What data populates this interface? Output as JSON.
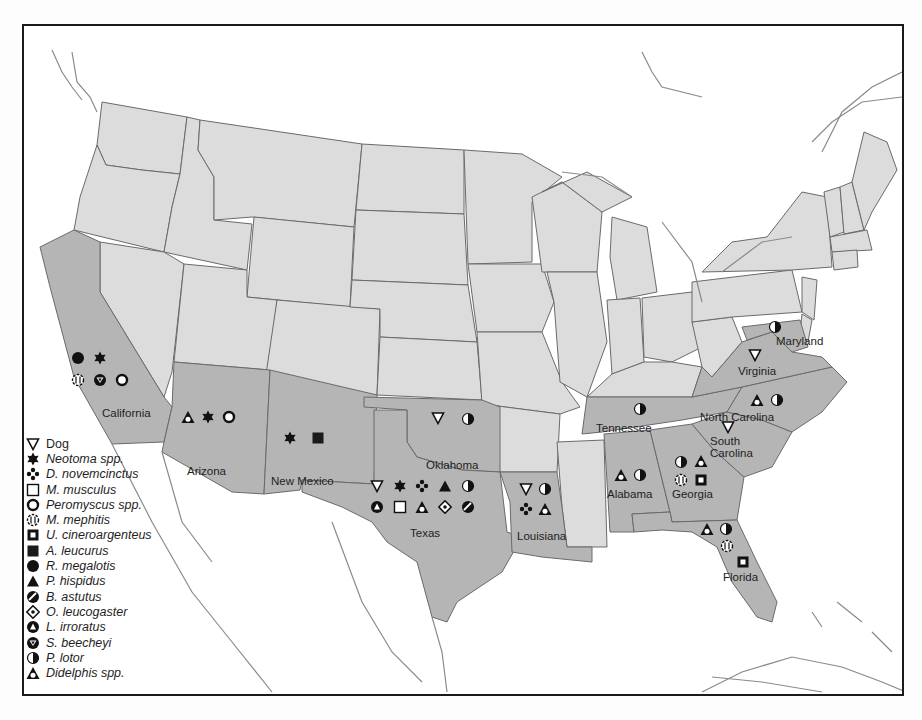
{
  "map": {
    "type": "choropleth-presence-map",
    "region": "Contiguous United States",
    "colors": {
      "highlighted_state": "#b5b5b5",
      "other_state": "#dcdcdc",
      "water": "#ffffff",
      "border": "#6a6a6a"
    }
  },
  "legend": {
    "items": [
      {
        "symbol": "triangle-down-open",
        "label": "Dog",
        "italic": false
      },
      {
        "symbol": "star-6-filled",
        "label": "Neotoma spp.",
        "italic": true
      },
      {
        "symbol": "four-dots-diamond",
        "label": "D. novemcinctus",
        "italic": true
      },
      {
        "symbol": "square-open",
        "label": "M. musculus",
        "italic": true
      },
      {
        "symbol": "circle-ring",
        "label": "Peromyscus spp.",
        "italic": true
      },
      {
        "symbol": "dashed-circle-stripes",
        "label": "M. mephitis",
        "italic": true
      },
      {
        "symbol": "square-ring",
        "label": "U. cineroargenteus",
        "italic": true
      },
      {
        "symbol": "square-filled",
        "label": "A. leucurus",
        "italic": true
      },
      {
        "symbol": "circle-filled",
        "label": "R. megalotis",
        "italic": true
      },
      {
        "symbol": "triangle-up-filled",
        "label": "P. hispidus",
        "italic": true
      },
      {
        "symbol": "circle-slash",
        "label": "B. astutus",
        "italic": true
      },
      {
        "symbol": "diamond-dot",
        "label": "O. leucogaster",
        "italic": true
      },
      {
        "symbol": "circle-triangle-up",
        "label": "L. irroratus",
        "italic": true
      },
      {
        "symbol": "circle-triangle-down",
        "label": "S. beecheyi",
        "italic": true
      },
      {
        "symbol": "half-circle",
        "label": "P. lotor",
        "italic": true
      },
      {
        "symbol": "triangle-up-ring",
        "label": "Didelphis spp.",
        "italic": true
      }
    ]
  },
  "states": [
    {
      "name": "California",
      "label": "California",
      "markers": [
        "circle-filled",
        "star-6-filled",
        "dashed-circle-stripes",
        "circle-triangle-down",
        "circle-ring"
      ]
    },
    {
      "name": "Arizona",
      "label": "Arizona",
      "markers": [
        "triangle-up-ring",
        "star-6-filled",
        "circle-ring"
      ]
    },
    {
      "name": "New Mexico",
      "label": "New Mexico",
      "markers": [
        "star-6-filled",
        "square-filled"
      ]
    },
    {
      "name": "Oklahoma",
      "label": "Oklahoma",
      "markers": [
        "triangle-down-open",
        "half-circle"
      ]
    },
    {
      "name": "Texas",
      "label": "Texas",
      "markers": [
        "triangle-down-open",
        "star-6-filled",
        "four-dots-diamond",
        "triangle-up-filled",
        "half-circle",
        "circle-triangle-up",
        "square-open",
        "triangle-up-ring",
        "diamond-dot",
        "circle-slash"
      ]
    },
    {
      "name": "Louisiana",
      "label": "Louisiana",
      "markers": [
        "triangle-down-open",
        "half-circle",
        "four-dots-diamond",
        "triangle-up-ring"
      ]
    },
    {
      "name": "Tennessee",
      "label": "Tennessee",
      "markers": [
        "half-circle"
      ]
    },
    {
      "name": "Alabama",
      "label": "Alabama",
      "markers": [
        "triangle-up-ring",
        "half-circle"
      ]
    },
    {
      "name": "Georgia",
      "label": "Georgia",
      "markers": [
        "half-circle",
        "triangle-up-ring",
        "dashed-circle-stripes",
        "square-ring"
      ]
    },
    {
      "name": "Florida",
      "label": "Florida",
      "markers": [
        "triangle-up-ring",
        "half-circle",
        "dashed-circle-stripes",
        "square-ring"
      ]
    },
    {
      "name": "South Carolina",
      "label": "South\nCarolina",
      "label_line1": "South",
      "label_line2": "Carolina",
      "markers": [
        "triangle-down-open"
      ]
    },
    {
      "name": "North Carolina",
      "label": "North Carolina",
      "markers": [
        "triangle-up-ring",
        "half-circle"
      ]
    },
    {
      "name": "Virginia",
      "label": "Virginia",
      "markers": [
        "triangle-down-open"
      ]
    },
    {
      "name": "Maryland",
      "label": "Maryland",
      "markers": [
        "half-circle"
      ]
    }
  ]
}
